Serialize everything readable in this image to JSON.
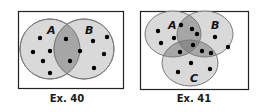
{
  "figures": [
    {
      "caption": "Ex. 40",
      "type": "venn-2-set",
      "sets": [
        {
          "label": "A"
        },
        {
          "label": "B"
        }
      ],
      "regions": {
        "A_only": 5,
        "A_and_B": 3,
        "B_only": 4
      }
    },
    {
      "caption": "Ex. 41",
      "type": "venn-3-set",
      "sets": [
        {
          "label": "A"
        },
        {
          "label": "B"
        },
        {
          "label": "C"
        }
      ],
      "regions": {
        "A_only": 4,
        "B_only": 2,
        "C_only": 3,
        "A_and_B_only": 2,
        "A_and_C_only": 1,
        "B_and_C_only": 2,
        "A_and_B_and_C": 1
      }
    }
  ],
  "colors": {
    "circle_fill": "#d9d9d9",
    "overlap_2_fill": "#a6a6a6",
    "overlap_3_fill": "#8c8c8c",
    "circle_stroke": "#7a7a7a",
    "frame_stroke": "#222222",
    "dot": "#000000"
  }
}
